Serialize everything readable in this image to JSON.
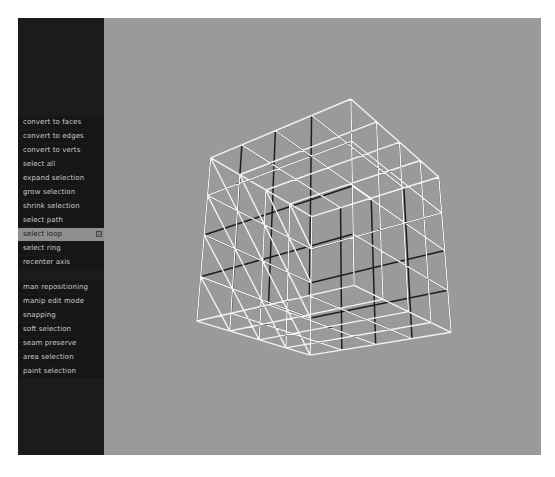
{
  "viewport": {
    "name": "3d-wireframe-viewport",
    "background_color": "#9a9a9a",
    "wire_selected_color": "#f2f2f2",
    "wire_unselected_color": "#1e1e1e",
    "mesh": {
      "shape": "cube",
      "subdivisions": 4,
      "display": "wireframe",
      "selection_mode": "edge-loop"
    }
  },
  "marking_menu": {
    "title": "",
    "background_color": "#1b1b1b",
    "highlight_color": "#8e8e8e",
    "text_color": "#c9c9c9",
    "groups": [
      {
        "name": "selection-commands",
        "items": [
          {
            "label": "convert to faces",
            "highlighted": false,
            "has_submenu": false
          },
          {
            "label": "convert to edges",
            "highlighted": false,
            "has_submenu": false
          },
          {
            "label": "convert to verts",
            "highlighted": false,
            "has_submenu": false
          },
          {
            "label": "select all",
            "highlighted": false,
            "has_submenu": false
          },
          {
            "label": "expand selection",
            "highlighted": false,
            "has_submenu": false
          },
          {
            "label": "grow selection",
            "highlighted": false,
            "has_submenu": false
          },
          {
            "label": "shrink selection",
            "highlighted": false,
            "has_submenu": false
          },
          {
            "label": "select path",
            "highlighted": false,
            "has_submenu": false
          },
          {
            "label": "select loop",
            "highlighted": true,
            "has_submenu": true
          },
          {
            "label": "select ring",
            "highlighted": false,
            "has_submenu": false
          },
          {
            "label": "recenter axis",
            "highlighted": false,
            "has_submenu": false
          }
        ]
      },
      {
        "name": "manipulation-commands",
        "items": [
          {
            "label": "man repositioning",
            "highlighted": false,
            "has_submenu": false
          },
          {
            "label": "manip edit mode",
            "highlighted": false,
            "has_submenu": false
          },
          {
            "label": "snapping",
            "highlighted": false,
            "has_submenu": false
          },
          {
            "label": "soft selection",
            "highlighted": false,
            "has_submenu": false
          },
          {
            "label": "seam preserve",
            "highlighted": false,
            "has_submenu": false
          },
          {
            "label": "area selection",
            "highlighted": false,
            "has_submenu": false
          },
          {
            "label": "paint selection",
            "highlighted": false,
            "has_submenu": false
          }
        ]
      }
    ]
  }
}
